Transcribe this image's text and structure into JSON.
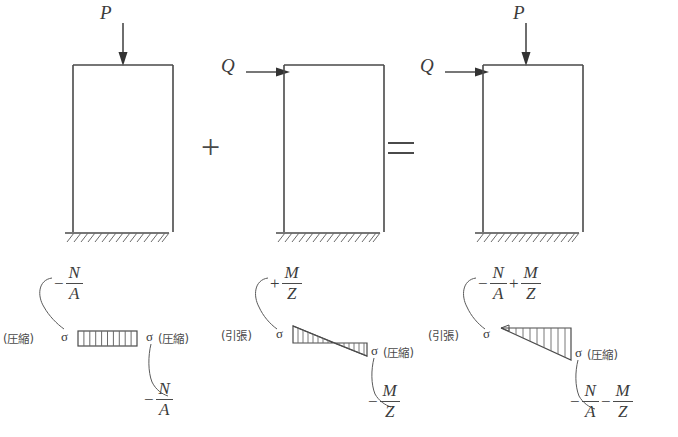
{
  "figure": {
    "title_visible": false
  },
  "colors": {
    "line": "#4a4a4a",
    "text": "#3b3b3b",
    "hatch": "#6a6a6a",
    "background": "#ffffff"
  },
  "operators": {
    "plus": "+",
    "equals": "="
  },
  "columns": [
    {
      "id": "column-axial",
      "loads": [
        {
          "name": "P",
          "label": "P",
          "direction": "down"
        }
      ]
    },
    {
      "id": "column-lateral",
      "loads": [
        {
          "name": "Q",
          "label": "Q",
          "direction": "right"
        }
      ]
    },
    {
      "id": "column-combined",
      "loads": [
        {
          "name": "Q",
          "label": "Q",
          "direction": "right"
        },
        {
          "name": "P",
          "label": "P",
          "direction": "down"
        }
      ]
    }
  ],
  "labels": {
    "compression": "(圧縮)",
    "tension": "(引張)",
    "sigma": "σ"
  },
  "stress_diagrams": [
    {
      "id": "stress-axial",
      "shape": "uniform-rectangle",
      "hatch_count": 10,
      "top_formula": {
        "sign": "−",
        "numerator": "N",
        "denominator": "A"
      },
      "bottom_formula": {
        "sign": "−",
        "numerator": "N",
        "denominator": "A"
      },
      "left_label": "(圧縮)",
      "right_label": "(圧縮)",
      "left_sigma": "σ",
      "right_sigma": "σ"
    },
    {
      "id": "stress-bending",
      "shape": "bowtie-two-triangles",
      "hatch_count": 8,
      "top_formula": {
        "sign": "+",
        "numerator": "M",
        "denominator": "Z"
      },
      "bottom_formula": {
        "sign": "−",
        "numerator": "M",
        "denominator": "Z"
      },
      "left_label": "(引張)",
      "right_label": "(圧縮)",
      "left_sigma": "σ",
      "right_sigma": "σ"
    },
    {
      "id": "stress-combined",
      "shape": "single-triangle",
      "hatch_count": 9,
      "top_formula_terms": [
        {
          "sign": "−",
          "numerator": "N",
          "denominator": "A"
        },
        {
          "sign": "+",
          "numerator": "M",
          "denominator": "Z"
        }
      ],
      "bottom_formula_terms": [
        {
          "sign": "−",
          "numerator": "N",
          "denominator": "A"
        },
        {
          "sign": "−",
          "numerator": "M",
          "denominator": "Z"
        }
      ],
      "left_label": "(引張)",
      "right_label": "(圧縮)",
      "left_sigma": "σ",
      "right_sigma": "σ"
    }
  ]
}
